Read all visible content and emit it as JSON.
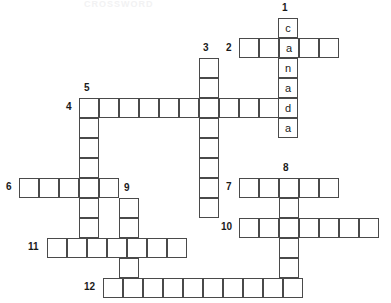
{
  "puzzle": {
    "title": "CROSSWORD",
    "cell_size": 20,
    "grid_color": "#4a4a4a",
    "cell_fill": "#ffffff",
    "letter_color": "#1a1a1a",
    "number_color": "#1a1a1a",
    "entries": [
      {
        "number": "1",
        "direction": "down",
        "label_x": 282,
        "label_y": 2,
        "start_x": 278,
        "start_y": 18,
        "length": 6,
        "letters": [
          "c",
          "a",
          "n",
          "a",
          "d",
          "a"
        ]
      },
      {
        "number": "2",
        "direction": "across",
        "label_x": 226,
        "label_y": 42,
        "start_x": 239,
        "start_y": 38,
        "length": 5,
        "letters": [
          "",
          "",
          "a",
          "",
          ""
        ]
      },
      {
        "number": "3",
        "direction": "down",
        "label_x": 203,
        "label_y": 42,
        "start_x": 199,
        "start_y": 58,
        "length": 8,
        "letters": [
          "",
          "",
          "",
          "",
          "",
          "",
          "",
          ""
        ]
      },
      {
        "number": "4",
        "direction": "across",
        "label_x": 66,
        "label_y": 101,
        "start_x": 79,
        "start_y": 98,
        "length": 10,
        "letters": [
          "",
          "",
          "",
          "",
          "",
          "",
          "",
          "",
          "",
          ""
        ]
      },
      {
        "number": "5",
        "direction": "down",
        "label_x": 84,
        "label_y": 82,
        "start_x": 79,
        "start_y": 98,
        "length": 8,
        "letters": [
          "",
          "",
          "",
          "",
          "",
          "",
          "",
          ""
        ]
      },
      {
        "number": "6",
        "direction": "across",
        "label_x": 6,
        "label_y": 181,
        "start_x": 19,
        "start_y": 178,
        "length": 5,
        "letters": [
          "",
          "",
          "",
          "",
          ""
        ]
      },
      {
        "number": "7",
        "direction": "across",
        "label_x": 226,
        "label_y": 181,
        "start_x": 239,
        "start_y": 178,
        "length": 5,
        "letters": [
          "",
          "",
          "",
          "",
          ""
        ]
      },
      {
        "number": "8",
        "direction": "down",
        "label_x": 283,
        "label_y": 162,
        "start_x": 279,
        "start_y": 178,
        "length": 6,
        "letters": [
          "",
          "",
          "",
          "",
          "",
          ""
        ]
      },
      {
        "number": "9",
        "direction": "down",
        "label_x": 124,
        "label_y": 182,
        "start_x": 119,
        "start_y": 198,
        "length": 5,
        "letters": [
          "",
          "",
          "",
          "",
          ""
        ]
      },
      {
        "number": "10",
        "direction": "across",
        "label_x": 221,
        "label_y": 221,
        "start_x": 239,
        "start_y": 218,
        "length": 7,
        "letters": [
          "",
          "",
          "",
          "",
          "",
          "",
          ""
        ]
      },
      {
        "number": "11",
        "direction": "across",
        "label_x": 28,
        "label_y": 241,
        "start_x": 47,
        "start_y": 238,
        "length": 7,
        "letters": [
          "",
          "",
          "",
          "",
          "",
          "",
          ""
        ]
      },
      {
        "number": "12",
        "direction": "across",
        "label_x": 84,
        "label_y": 281,
        "start_x": 103,
        "start_y": 278,
        "length": 10,
        "letters": [
          "",
          "",
          "",
          "",
          "",
          "",
          "",
          "",
          "",
          ""
        ]
      }
    ]
  }
}
